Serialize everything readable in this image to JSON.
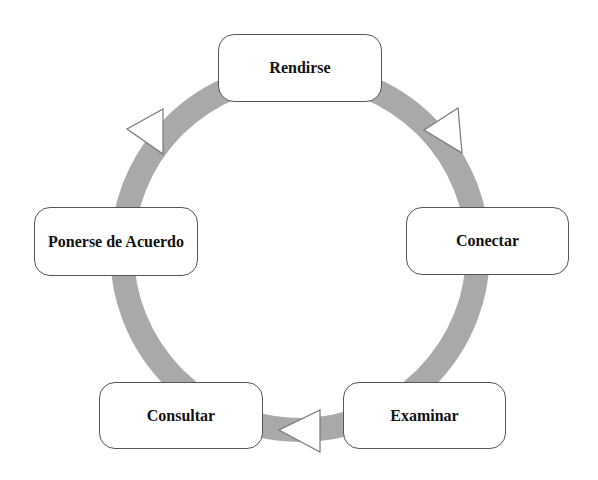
{
  "diagram": {
    "type": "cycle",
    "ring_color": "#a9a9a9",
    "arrow_fill": "#ffffff",
    "arrow_stroke": "#777777",
    "nodes": [
      {
        "id": "rendirse",
        "label": "Rendirse"
      },
      {
        "id": "conectar",
        "label": "Conectar"
      },
      {
        "id": "examinar",
        "label": "Examinar"
      },
      {
        "id": "consultar",
        "label": "Consultar"
      },
      {
        "id": "acuerdo",
        "label": "Ponerse de Acuerdo"
      }
    ],
    "arrows": [
      {
        "between": [
          "rendirse",
          "conectar"
        ],
        "direction": "clockwise"
      },
      {
        "between": [
          "examinar",
          "consultar"
        ],
        "direction": "clockwise"
      },
      {
        "between": [
          "acuerdo",
          "rendirse"
        ],
        "direction": "clockwise"
      }
    ]
  }
}
